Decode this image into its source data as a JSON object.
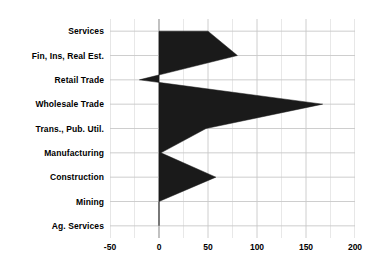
{
  "chart_data": {
    "type": "area",
    "title": "",
    "subtitle": "",
    "xlabel": "",
    "ylabel": "",
    "orientation": "horizontal",
    "grid": true,
    "legend": false,
    "xlim": [
      -50,
      200
    ],
    "xticks": [
      -50,
      0,
      50,
      100,
      150,
      200
    ],
    "xticklabels": [
      "-50",
      "0",
      "50",
      "100",
      "150",
      "200"
    ],
    "minor_xticks": [
      -25,
      25,
      75,
      125,
      175
    ],
    "categories": [
      "Services",
      "Fin, Ins, Real Est.",
      "Retail Trade",
      "Wholesale Trade",
      "Trans., Pub. Util.",
      "Manufacturing",
      "Construction",
      "Mining",
      "Ag. Services"
    ],
    "values": [
      50,
      80,
      -20,
      167,
      48,
      2,
      58,
      0,
      0
    ],
    "baseline": 0,
    "fill_color": "#1a1a1a",
    "grid_color": "#c8c8c8",
    "axis_color": "#a0a0a0",
    "text_color": "#000000"
  }
}
